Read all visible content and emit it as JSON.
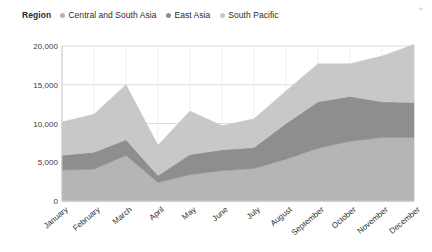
{
  "legend": {
    "title": "Region",
    "entries": [
      {
        "label": "Central and South Asia",
        "color": "#b5b5b5",
        "marker": "legend-dot-icon"
      },
      {
        "label": "East Asia",
        "color": "#8e8e8e",
        "marker": "legend-dot-icon"
      },
      {
        "label": "South Pacific",
        "color": "#c8c8c8",
        "marker": "legend-dot-icon"
      }
    ]
  },
  "chart_data": {
    "type": "area",
    "title": "",
    "subtitle": "",
    "xlabel": "",
    "ylabel": "",
    "stacked": true,
    "grid": true,
    "legend_position": "top-left",
    "ylim": [
      0,
      20000
    ],
    "yticks": [
      0,
      5000,
      10000,
      15000,
      20000
    ],
    "ytick_labels": [
      "0",
      "5,000",
      "10,000",
      "15,000",
      "20,000"
    ],
    "categories": [
      "January",
      "February",
      "March",
      "April",
      "May",
      "June",
      "July",
      "August",
      "September",
      "October",
      "November",
      "December"
    ],
    "series": [
      {
        "name": "Central and South Asia",
        "color": "#b5b5b5",
        "values": [
          4000,
          4100,
          5900,
          2400,
          3400,
          3900,
          4200,
          5400,
          6800,
          7700,
          8200,
          8200
        ]
      },
      {
        "name": "East Asia",
        "color": "#8e8e8e",
        "values": [
          1900,
          2200,
          2000,
          900,
          2600,
          2700,
          2700,
          4600,
          6000,
          5800,
          4600,
          4500
        ]
      },
      {
        "name": "South Pacific",
        "color": "#c8c8c8",
        "values": [
          4300,
          4900,
          7100,
          3900,
          5600,
          3100,
          3700,
          4200,
          4900,
          4200,
          5900,
          7500
        ]
      }
    ],
    "totals": [
      10200,
      11200,
      15000,
      7200,
      11600,
      9700,
      10600,
      14200,
      17700,
      17700,
      18700,
      20200
    ]
  },
  "colors": {
    "background": "#ffffff",
    "gridline": "#dcdcdc",
    "axis": "#c9c9c9",
    "text": "#2b2b2b"
  }
}
